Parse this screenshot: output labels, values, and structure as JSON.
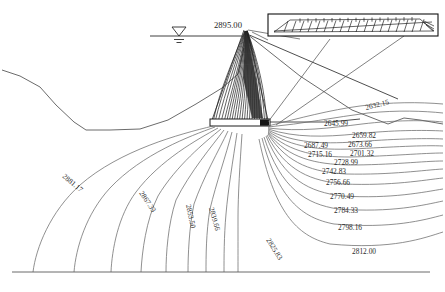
{
  "diagram": {
    "water_level": {
      "label": "2895.00",
      "symbol": "water-level-triangle"
    },
    "inset": {
      "name": "drainage-blanket-detail",
      "hatch_label": ""
    }
  },
  "chart_data": {
    "type": "contour",
    "xlabel": "",
    "ylabel": "",
    "units": "m",
    "reservoir_level": 2895.0,
    "contour_interval": 13.835,
    "levels": [
      2632.15,
      2645.99,
      2659.82,
      2673.66,
      2687.49,
      2701.32,
      2715.16,
      2728.99,
      2742.83,
      2756.66,
      2770.49,
      2784.33,
      2798.16,
      2812.0,
      2825.83,
      2839.66,
      2853.5,
      2867.33,
      2881.17
    ],
    "labels": [
      {
        "text": "2895.00",
        "x": 214,
        "y": 28,
        "rot": 0,
        "kind": "water-level"
      },
      {
        "text": "2632.15",
        "x": 366,
        "y": 110,
        "rot": -14,
        "kind": "contour"
      },
      {
        "text": "2645.99",
        "x": 324,
        "y": 126,
        "rot": 0,
        "kind": "contour"
      },
      {
        "text": "2659.82",
        "x": 352,
        "y": 138,
        "rot": 0,
        "kind": "contour"
      },
      {
        "text": "2687.49",
        "x": 304,
        "y": 148,
        "rot": 0,
        "kind": "contour"
      },
      {
        "text": "2673.66",
        "x": 348,
        "y": 147,
        "rot": 0,
        "kind": "contour"
      },
      {
        "text": "2715.16",
        "x": 308,
        "y": 157,
        "rot": 0,
        "kind": "contour"
      },
      {
        "text": "2701.32",
        "x": 350,
        "y": 156,
        "rot": 0,
        "kind": "contour"
      },
      {
        "text": "2728.99",
        "x": 334,
        "y": 165,
        "rot": 0,
        "kind": "contour"
      },
      {
        "text": "2742.83",
        "x": 322,
        "y": 174,
        "rot": 0,
        "kind": "contour"
      },
      {
        "text": "2756.66",
        "x": 326,
        "y": 185,
        "rot": 0,
        "kind": "contour"
      },
      {
        "text": "2770.49",
        "x": 330,
        "y": 199,
        "rot": 0,
        "kind": "contour"
      },
      {
        "text": "2784.33",
        "x": 334,
        "y": 213,
        "rot": 0,
        "kind": "contour"
      },
      {
        "text": "2798.16",
        "x": 338,
        "y": 230,
        "rot": 0,
        "kind": "contour"
      },
      {
        "text": "2812.00",
        "x": 352,
        "y": 254,
        "rot": 0,
        "kind": "contour"
      },
      {
        "text": "2825.83",
        "x": 266,
        "y": 240,
        "rot": 58,
        "kind": "contour"
      },
      {
        "text": "2839.66",
        "x": 209,
        "y": 208,
        "rot": 74,
        "kind": "contour"
      },
      {
        "text": "2853.50",
        "x": 186,
        "y": 205,
        "rot": 78,
        "kind": "contour"
      },
      {
        "text": "2867.33",
        "x": 139,
        "y": 193,
        "rot": 56,
        "kind": "contour"
      },
      {
        "text": "2881.17",
        "x": 62,
        "y": 177,
        "rot": 40,
        "kind": "contour"
      }
    ]
  }
}
